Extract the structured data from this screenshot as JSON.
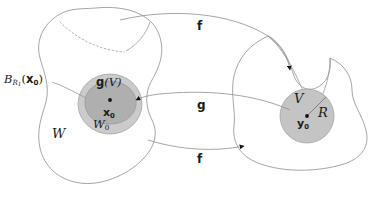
{
  "figure": {
    "type": "mathematical-diagram",
    "background_color": "#ffffff",
    "stroke_color": "#8a8a8a",
    "text_color": "#1a1a1a",
    "shades": {
      "outer_disk": "#cbcbcb",
      "inner_blob": "#afafaf",
      "right_ball": "#c4c4c4"
    }
  },
  "labels": {
    "ball_left": "B",
    "ball_left_sub": "R",
    "ball_left_sub2": "1",
    "ball_left_arg": "(",
    "ball_left_point": "x",
    "ball_left_point_sub": "0",
    "ball_left_close": ")",
    "image_of_V": "g",
    "image_of_V_arg": "(V)",
    "center_left": "x",
    "center_left_sub": "0",
    "neighborhood_W0": "W",
    "neighborhood_W0_sub": "0",
    "domain_W": "W",
    "map_f_top": "f",
    "map_g_middle": "g",
    "map_f_bottom": "f",
    "set_V": "V",
    "radius_R": "R",
    "center_right": "y",
    "center_right_sub": "0"
  }
}
